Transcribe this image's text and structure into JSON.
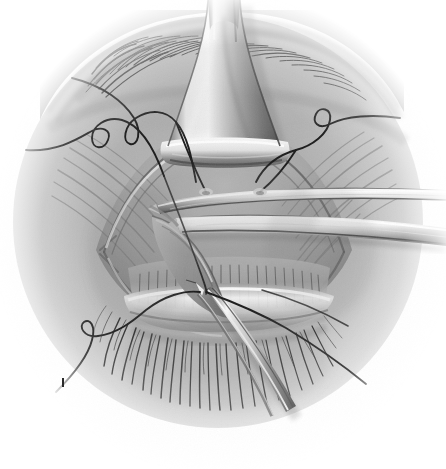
{
  "figure": {
    "domain": "medical-illustration",
    "title": "Eyelid ptosis repair — levator aponeurosis advancement",
    "medium": "grayscale airbrush and pencil rendering",
    "background_color": "#ffffff",
    "vignette_color": "#b8b8b8",
    "ink_color": "#1d1d1d",
    "tissue_midtone": "#9e9e9e",
    "highlight_color": "#f2f2f2",
    "shadow_color": "#4a4a4a",
    "canvas": {
      "width": 446,
      "height": 469
    },
    "corner_mark": "I"
  },
  "anatomy": {
    "eyebrow": {
      "label": "eyebrow",
      "hair_count": 34,
      "region": "upper left arc"
    },
    "tented_flap": {
      "label": "levator aponeurosis tented upward",
      "apex_y": 0,
      "base_y": 145
    },
    "orbital_septum": {
      "label": "orbital septum and preaponeurotic fat plane"
    },
    "tarsal_plate": {
      "label": "tarsal plate with meibomian gland striations",
      "gland_count": 26
    },
    "eyelashes": {
      "label": "lower lash row",
      "lash_count": 40
    },
    "skin_crease": {
      "label": "upper lid skin crease incision"
    }
  },
  "instruments": [
    {
      "name": "retractor-blade-upper",
      "label": "upper retractor blade",
      "orientation": "horizontal, extends to right edge"
    },
    {
      "name": "retractor-blade-lower",
      "label": "lower retractor blade",
      "orientation": "horizontal, extends to right edge"
    },
    {
      "name": "fine-forceps",
      "label": "fine-toothed forceps",
      "orientation": "angled down-right toward lash line"
    }
  ],
  "sutures": [
    {
      "name": "suture-upper-left",
      "label": "upper left double-armed suture",
      "ink": "#1a1a1a"
    },
    {
      "name": "suture-mid-left",
      "label": "mid left double-armed suture",
      "ink": "#1a1a1a"
    },
    {
      "name": "suture-upper-right",
      "label": "upper right double-armed suture",
      "ink": "#1a1a1a"
    },
    {
      "name": "suture-lower-left",
      "label": "lower left suture tail",
      "ink": "#1a1a1a"
    },
    {
      "name": "suture-lower-right",
      "label": "lower right suture tail",
      "ink": "#1a1a1a"
    },
    {
      "name": "suture-pass-left",
      "label": "suture passing into tarsus, left bite",
      "ink": "#1a1a1a"
    },
    {
      "name": "suture-pass-right",
      "label": "suture passing into tarsus, right bite",
      "ink": "#1a1a1a"
    }
  ]
}
